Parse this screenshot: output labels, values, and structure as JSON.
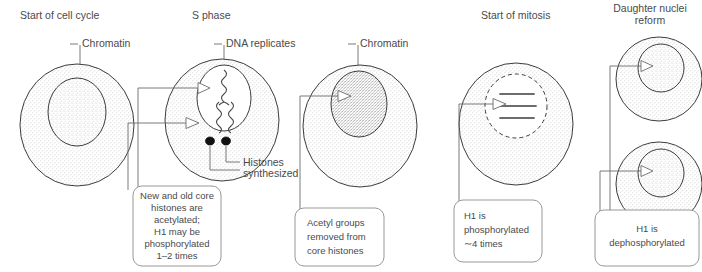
{
  "figure": {
    "kind": "biology-diagram",
    "ink_color": "#4a4a4a",
    "outline_color": "#3c3c3c",
    "box_border_color": "#8c8c8c",
    "background": "#ffffff"
  },
  "panels": [
    {
      "id": "start-of-cell-cycle",
      "title": "Start of cell cycle",
      "callouts": [
        {
          "id": "chromatin",
          "label": "Chromatin"
        }
      ],
      "note": null
    },
    {
      "id": "s-phase",
      "title": "S phase",
      "callouts": [
        {
          "id": "dna-replicates",
          "label": "DNA replicates"
        },
        {
          "id": "histones-synthesized",
          "label": "Histones\nsynthesized",
          "line1": "Histones",
          "line2": "synthesized"
        }
      ],
      "note": {
        "id": "note-s-phase",
        "lines": [
          "New and old core",
          "histones  are",
          "acetylated;",
          "H1 may be",
          "phosphorylated",
          "1–2 times"
        ]
      }
    },
    {
      "id": "post-s-phase",
      "title": "",
      "callouts": [
        {
          "id": "chromatin-2",
          "label": "Chromatin"
        }
      ],
      "note": {
        "id": "note-acetyl-removed",
        "lines": [
          "Acetyl groups",
          "removed from",
          "core histones"
        ]
      }
    },
    {
      "id": "start-of-mitosis",
      "title": "Start of mitosis",
      "callouts": [],
      "note": {
        "id": "note-h1-phosphorylated",
        "lines": [
          "H1 is",
          "phosphorylated",
          "∼4 times"
        ]
      }
    },
    {
      "id": "daughter-nuclei-reform",
      "title_line1": "Daughter nuclei",
      "title_line2": "reform",
      "title": "Daughter nuclei reform",
      "callouts": [],
      "note": {
        "id": "note-h1-dephosphorylated",
        "lines": [
          "H1 is",
          "dephosphorylated"
        ]
      }
    }
  ]
}
